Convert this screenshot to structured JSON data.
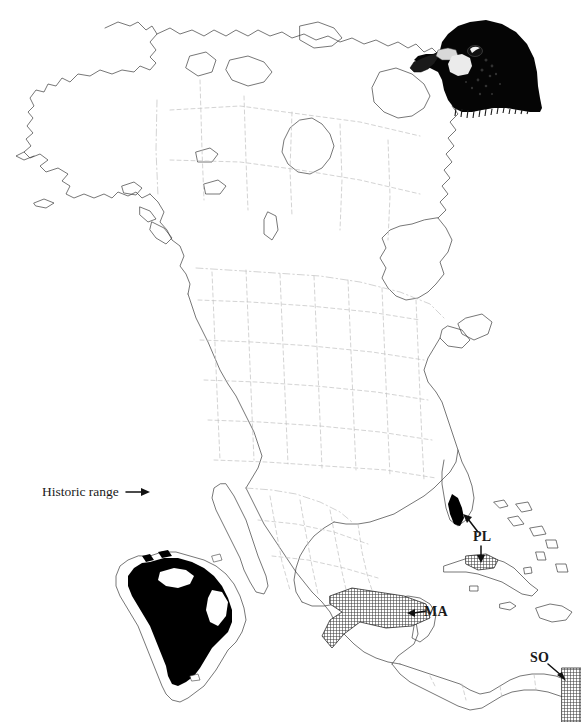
{
  "figure": {
    "type": "distribution-map",
    "region": "North America, Central America, Caribbean and South America",
    "background_color": "#ffffff",
    "outline_color": "#3c3c3c",
    "border_color": "#b4b4b4",
    "historic_range_color": "#000000",
    "current_range_color": "#4a4a4a",
    "width": 581,
    "height": 722
  },
  "labels": {
    "historic_range": "Historic range",
    "pl": "PL",
    "ma": "MA",
    "so": "SO"
  },
  "illustration": {
    "name": "falcon-head",
    "description": "dark falcon head in profile facing left with hooked beak, pale cere and cheek patch, highlighted eye"
  },
  "map_data": {
    "historic_range_areas": [
      "South America interior",
      "southern Florida",
      "western Cuba"
    ],
    "current_range_patches": [
      {
        "label": "PL",
        "location": "western Cuba and southern Florida tip"
      },
      {
        "label": "MA",
        "location": "southern Mexico isthmus"
      },
      {
        "label": "SO",
        "location": "eastern Panama / Central America"
      }
    ]
  }
}
